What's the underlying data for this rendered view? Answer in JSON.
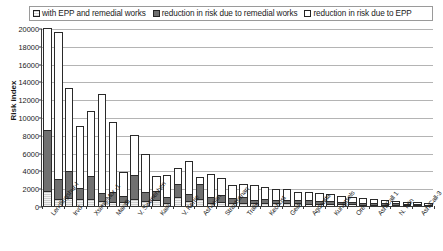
{
  "legend": {
    "items": [
      {
        "label": "with EPP and remedial works",
        "icon": "hatched-square-icon",
        "color": "#d9d9d9"
      },
      {
        "label": "reduction in risk due to remedial works",
        "icon": "filled-square-icon",
        "color": "#6e6e6e"
      },
      {
        "label": "reduction in risk due to EPP",
        "icon": "empty-square-icon",
        "color": "#ffffff"
      }
    ]
  },
  "chart_data": {
    "type": "bar",
    "title": "",
    "subtitle": "",
    "xlabel": "",
    "ylabel": "Risk index",
    "ylim": [
      0,
      20000
    ],
    "ytick_values": [
      0,
      2000,
      4000,
      6000,
      8000,
      10000,
      12000,
      14000,
      16000,
      18000,
      20000
    ],
    "ytick_labels": [
      "0",
      "2000",
      "4000",
      "6000",
      "8000",
      "10000",
      "12000",
      "14000",
      "16000",
      "18000",
      "20000"
    ],
    "grid": true,
    "legend_position": "top",
    "stacked": true,
    "bars_per_category": 2,
    "categories": [
      "Lendlingshur-I",
      "Irvd",
      "Xsimg/Mor -1",
      "Maralli",
      "V. Swanenhen",
      "Kairi",
      "V. Kerrie",
      "Asharian",
      "Strantsenan",
      "Tralik",
      "Kechost",
      "Gelik",
      "Agdnatta",
      "Kunigtsels",
      "Ore",
      "AshiCall 1",
      "N. Tain",
      "AshiCall-3"
    ],
    "series": [
      {
        "name": "with EPP and remedial works",
        "color": "#d9d9d9",
        "values": [
          [
            1800,
            900
          ],
          [
            1000,
            900
          ],
          [
            900,
            700
          ],
          [
            600,
            600
          ],
          [
            900,
            700
          ],
          [
            800,
            500
          ],
          [
            1100,
            700
          ],
          [
            950,
            500
          ],
          [
            600,
            500
          ],
          [
            500,
            450
          ],
          [
            450,
            400
          ],
          [
            400,
            400
          ],
          [
            350,
            350
          ],
          [
            350,
            300
          ],
          [
            300,
            280
          ],
          [
            260,
            250
          ],
          [
            230,
            220
          ],
          [
            200,
            170
          ]
        ]
      },
      {
        "name": "reduction in risk due to remedial works",
        "color": "#6e6e6e",
        "values": [
          [
            7000,
            2400
          ],
          [
            3200,
            1400
          ],
          [
            2700,
            1000
          ],
          [
            1200,
            800
          ],
          [
            2800,
            1100
          ],
          [
            1100,
            700
          ],
          [
            1600,
            900
          ],
          [
            1800,
            700
          ],
          [
            900,
            650
          ],
          [
            700,
            500
          ],
          [
            600,
            500
          ],
          [
            550,
            450
          ],
          [
            500,
            400
          ],
          [
            450,
            350
          ],
          [
            400,
            300
          ],
          [
            350,
            280
          ],
          [
            300,
            250
          ],
          [
            260,
            200
          ]
        ]
      },
      {
        "name": "reduction in risk due to EPP",
        "color": "#ffffff",
        "values": [
          [
            11500,
            16600
          ],
          [
            9400,
            7000
          ],
          [
            7400,
            11200
          ],
          [
            8000,
            2800
          ],
          [
            4600,
            4400
          ],
          [
            1800,
            2600
          ],
          [
            1900,
            3800
          ],
          [
            900,
            2700
          ],
          [
            2000,
            1500
          ],
          [
            1600,
            1700
          ],
          [
            1400,
            1400
          ],
          [
            1300,
            1100
          ],
          [
            1100,
            1000
          ],
          [
            900,
            800
          ],
          [
            700,
            650
          ],
          [
            500,
            450
          ],
          [
            400,
            350
          ],
          [
            320,
            260
          ]
        ]
      }
    ]
  }
}
